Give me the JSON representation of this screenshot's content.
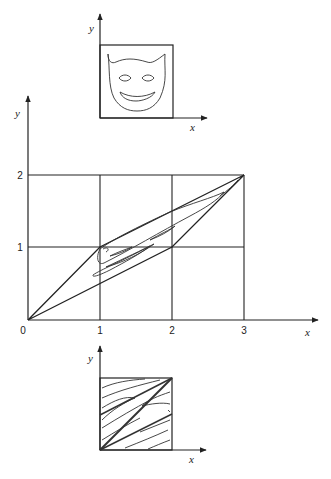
{
  "top_plot": {
    "x_axis_label": "x",
    "y_axis_label": "y",
    "content": "devil-face"
  },
  "main_plot": {
    "x_axis_label": "x",
    "y_axis_label": "y",
    "x_ticks": [
      "0",
      "1",
      "2",
      "3"
    ],
    "y_ticks": [
      "1",
      "2"
    ],
    "grid": "3x2 unit squares"
  },
  "bottom_plot": {
    "x_axis_label": "x",
    "y_axis_label": "y",
    "content": "stretched-folded-face"
  }
}
